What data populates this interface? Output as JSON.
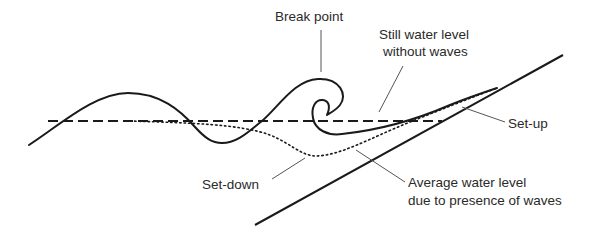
{
  "diagram": {
    "labels": {
      "break_point": "Break point",
      "still_water_line1": "Still water level",
      "still_water_line2": "without waves",
      "set_up": "Set-up",
      "set_down": "Set-down",
      "average_line1": "Average water level",
      "average_line2": "due to presence of waves"
    },
    "colors": {
      "stroke": "#1a1a1a",
      "leader": "#555555",
      "background": "#ffffff"
    }
  }
}
